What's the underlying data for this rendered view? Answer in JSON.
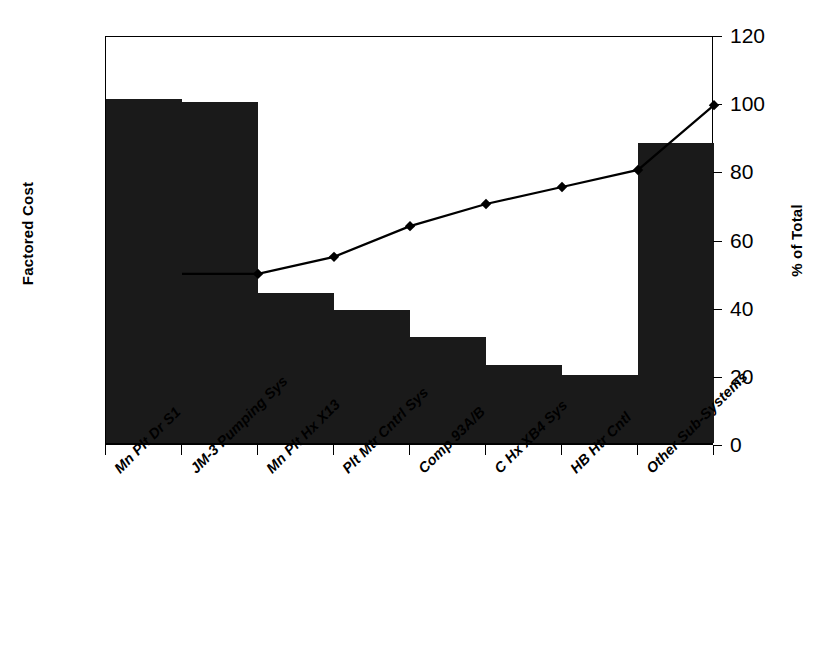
{
  "chart_data": {
    "type": "bar",
    "title": "",
    "subtitle": "",
    "xlabel": "",
    "ylabel": "Factored Cost",
    "y2label": "% of Total",
    "categories": [
      "Mn Plt Dr S1",
      "JM-3 Pumping Sys",
      "Mn Plt Hx X13",
      "Plt Mtr Cntrl Sys",
      "Comp 93A/B",
      "C Hx XB4 Sys",
      "HB Htr Cntl",
      "Other Sub-Systems"
    ],
    "series": [
      {
        "name": "Factored Cost",
        "kind": "bar",
        "axis": "left",
        "values": [
          101,
          100,
          44,
          39,
          31,
          23,
          20,
          88
        ]
      },
      {
        "name": "% of Total",
        "kind": "line",
        "axis": "right",
        "marker": "diamond",
        "values": [
          null,
          50.5,
          55.5,
          64.5,
          71,
          76,
          81,
          100
        ]
      }
    ],
    "ylim": [
      0,
      120
    ],
    "y2lim": [
      0,
      120
    ],
    "y2ticks": [
      0,
      20,
      40,
      60,
      80,
      100,
      120
    ],
    "yticks_labels_left": [],
    "grid": false,
    "legend": false,
    "legend_position": "none",
    "bar_color": "#1a1a1a",
    "line_color": "#000000",
    "frame": true
  },
  "axes": {
    "left_title": "Factored Cost",
    "right_title": "% of Total",
    "right_ticks": [
      {
        "value": 120,
        "label": "120"
      },
      {
        "value": 100,
        "label": "100"
      },
      {
        "value": 80,
        "label": "80"
      },
      {
        "value": 60,
        "label": "60"
      },
      {
        "value": 40,
        "label": "40"
      },
      {
        "value": 20,
        "label": "20"
      },
      {
        "value": 0,
        "label": "0"
      }
    ]
  },
  "categories": [
    {
      "label": "Mn Plt Dr S1"
    },
    {
      "label": "JM-3 Pumping Sys"
    },
    {
      "label": "Mn Plt Hx X13"
    },
    {
      "label": "Plt Mtr Cntrl Sys"
    },
    {
      "label": "Comp 93A/B"
    },
    {
      "label": "C Hx XB4 Sys"
    },
    {
      "label": "HB Htr Cntl"
    },
    {
      "label": "Other Sub-Systems"
    }
  ]
}
